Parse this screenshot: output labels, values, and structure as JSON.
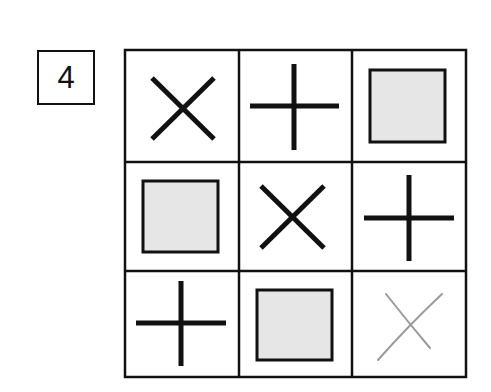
{
  "puzzle": {
    "number": "4",
    "grid": {
      "rows": 3,
      "cols": 3,
      "cells": [
        [
          "x",
          "plus",
          "square"
        ],
        [
          "square",
          "x",
          "plus"
        ],
        [
          "plus",
          "square",
          "x-light"
        ]
      ]
    },
    "colors": {
      "stroke": "#111111",
      "square_fill": "#e6e6e6",
      "light_x": "#9a9a9a",
      "background": "#ffffff"
    }
  }
}
